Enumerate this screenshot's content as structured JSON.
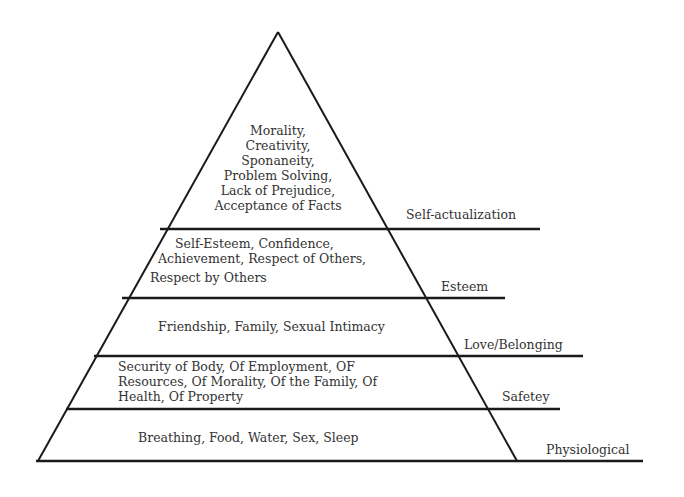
{
  "diagram": {
    "stroke_color": "#1a1a1a",
    "text_color": "#333333",
    "tiers": [
      {
        "label": "Self-actualization",
        "lines": [
          "Morality,",
          "Creativity,",
          "Sponaneity,",
          "Problem Solving,",
          "Lack of Prejudice,",
          "Acceptance of Facts"
        ]
      },
      {
        "label": "Esteem",
        "lines": [
          "Self-Esteem, Confidence,",
          "Achievement, Respect of Others,",
          "Respect by Others"
        ]
      },
      {
        "label": "Love/Belonging",
        "lines": [
          "Friendship, Family, Sexual Intimacy"
        ]
      },
      {
        "label": "Safetey",
        "lines": [
          "Security of Body, Of Employment, OF",
          "Resources, Of Morality, Of the Family, Of",
          "Health, Of Property"
        ]
      },
      {
        "label": "Physiological",
        "lines": [
          "Breathing, Food, Water, Sex, Sleep"
        ]
      }
    ]
  }
}
